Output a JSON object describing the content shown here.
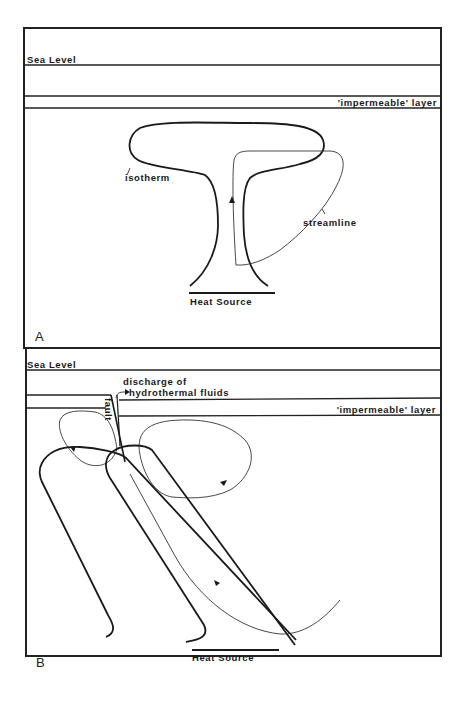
{
  "figure": {
    "panels": [
      {
        "id": "A",
        "panel_label": "A",
        "sea_level_label": "Sea Level",
        "impermeable_label": "'impermeable' layer",
        "isotherm_label": "isotherm",
        "streamline_label": "streamline",
        "heat_source_label": "Heat Source"
      },
      {
        "id": "B",
        "panel_label": "B",
        "sea_level_label": "Sea Level",
        "impermeable_label": "'impermeable' layer",
        "discharge_label_line1": "discharge of",
        "discharge_label_line2": "hydrothermal fluids",
        "fault_label": "fault",
        "heat_source_label": "Heat Source"
      }
    ],
    "colors": {
      "ink": "#1a1a1a",
      "background": "#ffffff"
    }
  }
}
